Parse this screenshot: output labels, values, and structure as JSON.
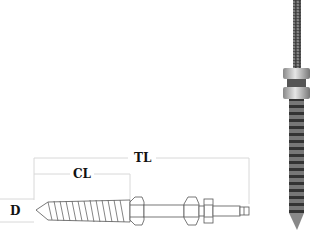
{
  "diagram": {
    "labels": {
      "total_length": "TL",
      "cone_length": "CL",
      "diameter": "D"
    },
    "components": [
      "wood-screw-thread-end",
      "hex-collar",
      "machine-thread-shank",
      "hex-nut",
      "lock-nut"
    ],
    "photo": "vertical-product-photo"
  }
}
